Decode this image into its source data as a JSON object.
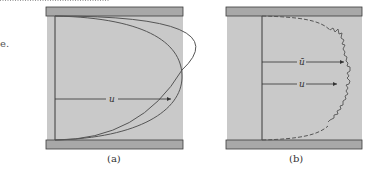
{
  "figure": {
    "text_fragment": "e.",
    "colors": {
      "fluid_fill": "#c9c9c9",
      "plate_fill": "#a8a8a8",
      "line": "#3a3a3a",
      "profile_laminar": "#5a5a5a",
      "profile_turbulent": "#5a5a5a"
    },
    "panels": [
      {
        "id": "a",
        "caption": "(a)",
        "description": "Laminar flow between parallel plates - parabolic velocity profile",
        "arrows": [
          {
            "label": "u"
          }
        ]
      },
      {
        "id": "b",
        "caption": "(b)",
        "description": "Turbulent flow between parallel plates - fluctuating velocity profile with mean",
        "arrows": [
          {
            "label": "ū"
          },
          {
            "label": "u"
          }
        ]
      }
    ]
  }
}
